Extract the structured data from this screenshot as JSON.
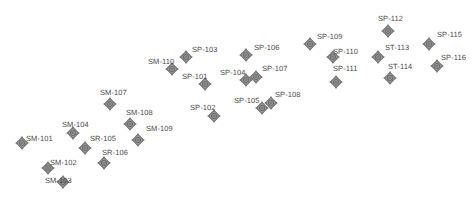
{
  "figure": {
    "title": "",
    "background_color": "#ffffff",
    "marker_color": "#6e6e6e",
    "marker_fill": "#9a9a9a",
    "label_color": "#4a4a4a",
    "marker_icon": "diamond-star-survey-point-icon",
    "width": 473,
    "height": 209
  },
  "chart_data": {
    "type": "scatter",
    "title": "",
    "xlabel": "",
    "ylabel": "",
    "xlim": [
      0,
      473
    ],
    "ylim": [
      0,
      209
    ],
    "grid": false,
    "legend": null,
    "point_label_count": 23,
    "series": [
      {
        "name": "SM",
        "points": [
          {
            "label": "SM-101",
            "x": 22,
            "y": 143,
            "label_x": 26,
            "label_y": 134,
            "label_align": "left"
          },
          {
            "label": "SM-102",
            "x": 48,
            "y": 168,
            "label_x": 50,
            "label_y": 158,
            "label_align": "left"
          },
          {
            "label": "SM-103",
            "x": 63,
            "y": 182,
            "label_x": 45,
            "label_y": 176,
            "label_align": "left"
          },
          {
            "label": "SM-104",
            "x": 73,
            "y": 133,
            "label_x": 62,
            "label_y": 120,
            "label_align": "left"
          },
          {
            "label": "SM-107",
            "x": 110,
            "y": 104,
            "label_x": 100,
            "label_y": 88,
            "label_align": "left"
          },
          {
            "label": "SM-108",
            "x": 130,
            "y": 124,
            "label_x": 126,
            "label_y": 108,
            "label_align": "left"
          },
          {
            "label": "SM-109",
            "x": 138,
            "y": 140,
            "label_x": 146,
            "label_y": 124,
            "label_align": "left"
          },
          {
            "label": "SM-110",
            "x": 172,
            "y": 69,
            "label_x": 148,
            "label_y": 57,
            "label_align": "left"
          }
        ]
      },
      {
        "name": "SR",
        "points": [
          {
            "label": "SR-105",
            "x": 85,
            "y": 148,
            "label_x": 90,
            "label_y": 134,
            "label_align": "left"
          },
          {
            "label": "SR-106",
            "x": 104,
            "y": 163,
            "label_x": 102,
            "label_y": 148,
            "label_align": "left"
          }
        ]
      },
      {
        "name": "SP",
        "points": [
          {
            "label": "SP-101",
            "x": 205,
            "y": 84,
            "label_x": 182,
            "label_y": 72,
            "label_align": "left"
          },
          {
            "label": "SP-102",
            "x": 214,
            "y": 116,
            "label_x": 190,
            "label_y": 103,
            "label_align": "left"
          },
          {
            "label": "SP-103",
            "x": 186,
            "y": 57,
            "label_x": 192,
            "label_y": 45,
            "label_align": "left"
          },
          {
            "label": "SP-104",
            "x": 246,
            "y": 80,
            "label_x": 220,
            "label_y": 68,
            "label_align": "left"
          },
          {
            "label": "SP-105",
            "x": 262,
            "y": 108,
            "label_x": 234,
            "label_y": 96,
            "label_align": "left"
          },
          {
            "label": "SP-106",
            "x": 246,
            "y": 55,
            "label_x": 254,
            "label_y": 43,
            "label_align": "left"
          },
          {
            "label": "SP-107",
            "x": 256,
            "y": 77,
            "label_x": 262,
            "label_y": 64,
            "label_align": "left"
          },
          {
            "label": "SP-108",
            "x": 271,
            "y": 103,
            "label_x": 275,
            "label_y": 90,
            "label_align": "left"
          },
          {
            "label": "SP-109",
            "x": 310,
            "y": 44,
            "label_x": 317,
            "label_y": 32,
            "label_align": "left"
          },
          {
            "label": "SP-110",
            "x": 333,
            "y": 57,
            "label_x": 333,
            "label_y": 47,
            "label_align": "left"
          },
          {
            "label": "SP-111",
            "x": 336,
            "y": 82,
            "label_x": 333,
            "label_y": 64,
            "label_align": "left"
          },
          {
            "label": "SP-112",
            "x": 388,
            "y": 31,
            "label_x": 378,
            "label_y": 14,
            "label_align": "left"
          },
          {
            "label": "SP-115",
            "x": 429,
            "y": 44,
            "label_x": 437,
            "label_y": 30,
            "label_align": "left"
          },
          {
            "label": "SP-116",
            "x": 437,
            "y": 66,
            "label_x": 441,
            "label_y": 53,
            "label_align": "left"
          }
        ]
      },
      {
        "name": "ST",
        "points": [
          {
            "label": "ST-113",
            "x": 378,
            "y": 57,
            "label_x": 385,
            "label_y": 43,
            "label_align": "left"
          },
          {
            "label": "ST-114",
            "x": 390,
            "y": 78,
            "label_x": 388,
            "label_y": 62,
            "label_align": "left"
          }
        ]
      }
    ]
  }
}
